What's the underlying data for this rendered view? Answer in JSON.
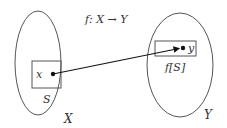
{
  "diagram": {
    "mapping_label": "f: X → Y",
    "domain_set": {
      "label": "X",
      "subset_label": "S",
      "element_label": "x"
    },
    "codomain_set": {
      "label": "Y",
      "image_label": "f[S]",
      "element_label": "y"
    },
    "colors": {
      "stroke": "#555555",
      "text": "#333333",
      "arrow": "#111111",
      "background": "#ffffff"
    }
  }
}
